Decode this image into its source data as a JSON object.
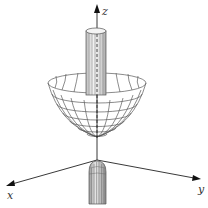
{
  "figure": {
    "axes": {
      "x_label": "x",
      "y_label": "y",
      "z_label": "z"
    },
    "colors": {
      "line": "#555555",
      "axis": "#222222",
      "background": "#ffffff"
    }
  }
}
